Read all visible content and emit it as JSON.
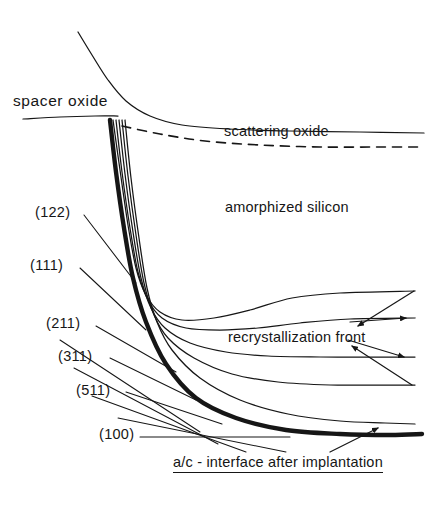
{
  "figure": {
    "domain": "diagram",
    "background_color": "#ffffff",
    "ink_color": "#161616",
    "width": 439,
    "height": 512
  },
  "labels": {
    "spacer_oxide": "spacer  oxide",
    "scattering_oxide": "scattering oxide",
    "amorphized_silicon": "amorphized silicon",
    "recrystallization_front": "recrystallization front",
    "ac_interface": "a/c - interface after implantation"
  },
  "miller_indices": [
    {
      "label": "(122)",
      "id": "122"
    },
    {
      "label": "(111)",
      "id": "111"
    },
    {
      "label": "(211)",
      "id": "211"
    },
    {
      "label": "(311)",
      "id": "311"
    },
    {
      "label": "(511)",
      "id": "511"
    },
    {
      "label": "(100)",
      "id": "100"
    }
  ],
  "chart_data": {
    "type": "line",
    "xlabel": "",
    "ylabel": "",
    "grid": false,
    "legend": "none",
    "axis_ranges": {
      "x": [
        0,
        439
      ],
      "y": [
        0,
        512
      ]
    },
    "note": "Pixel coordinates, y increases downward, matching the source raster.",
    "series": [
      {
        "name": "spacer-oxide-top-surface",
        "style": "solid-thin",
        "points": [
          [
            78,
            32
          ],
          [
            92,
            55
          ],
          [
            108,
            80
          ],
          [
            126,
            101
          ],
          [
            150,
            116
          ],
          [
            182,
            125
          ],
          [
            228,
            129
          ],
          [
            290,
            131
          ],
          [
            360,
            132
          ],
          [
            424,
            133
          ]
        ]
      },
      {
        "name": "spacer-oxide-base-line",
        "style": "solid-thin",
        "points": [
          [
            23,
            119
          ],
          [
            60,
            117
          ],
          [
            95,
            116
          ],
          [
            118,
            116
          ]
        ]
      },
      {
        "name": "scattering-oxide-dashed",
        "style": "dashed",
        "points": [
          [
            122,
            126
          ],
          [
            160,
            134
          ],
          [
            205,
            141
          ],
          [
            260,
            145
          ],
          [
            320,
            147
          ],
          [
            380,
            147
          ],
          [
            424,
            147
          ]
        ]
      },
      {
        "name": "recryst-front-1",
        "style": "solid-thin",
        "points": [
          [
            113,
            120
          ],
          [
            120,
            170
          ],
          [
            128,
            225
          ],
          [
            136,
            268
          ],
          [
            146,
            295
          ],
          [
            160,
            312
          ],
          [
            182,
            320
          ],
          [
            214,
            318
          ],
          [
            250,
            310
          ],
          [
            292,
            298
          ],
          [
            340,
            293
          ],
          [
            415,
            291
          ]
        ]
      },
      {
        "name": "recryst-front-2",
        "style": "solid-thin",
        "points": [
          [
            116,
            120
          ],
          [
            122,
            172
          ],
          [
            130,
            228
          ],
          [
            138,
            272
          ],
          [
            148,
            300
          ],
          [
            162,
            318
          ],
          [
            186,
            328
          ],
          [
            220,
            330
          ],
          [
            258,
            328
          ],
          [
            300,
            323
          ],
          [
            350,
            319
          ],
          [
            415,
            318
          ]
        ]
      },
      {
        "name": "recryst-front-3",
        "style": "solid-thin",
        "points": [
          [
            119,
            120
          ],
          [
            125,
            174
          ],
          [
            133,
            232
          ],
          [
            141,
            278
          ],
          [
            151,
            308
          ],
          [
            165,
            328
          ],
          [
            190,
            343
          ],
          [
            226,
            352
          ],
          [
            268,
            356
          ],
          [
            320,
            357
          ],
          [
            370,
            357
          ],
          [
            415,
            357
          ]
        ]
      },
      {
        "name": "recryst-front-4",
        "style": "solid-thin",
        "points": [
          [
            122,
            120
          ],
          [
            128,
            176
          ],
          [
            136,
            235
          ],
          [
            144,
            283
          ],
          [
            154,
            315
          ],
          [
            168,
            338
          ],
          [
            194,
            358
          ],
          [
            232,
            374
          ],
          [
            278,
            382
          ],
          [
            330,
            385
          ],
          [
            378,
            385
          ],
          [
            415,
            385
          ]
        ]
      },
      {
        "name": "recryst-front-5",
        "style": "solid-thin",
        "points": [
          [
            125,
            120
          ],
          [
            131,
            178
          ],
          [
            139,
            238
          ],
          [
            147,
            288
          ],
          [
            157,
            322
          ],
          [
            172,
            350
          ],
          [
            200,
            378
          ],
          [
            240,
            400
          ],
          [
            288,
            414
          ],
          [
            340,
            421
          ],
          [
            385,
            423
          ],
          [
            415,
            424
          ]
        ]
      },
      {
        "name": "ac-interface-thick",
        "style": "solid-thick",
        "points": [
          [
            110,
            120
          ],
          [
            116,
            172
          ],
          [
            124,
            228
          ],
          [
            133,
            278
          ],
          [
            146,
            322
          ],
          [
            166,
            364
          ],
          [
            196,
            398
          ],
          [
            236,
            418
          ],
          [
            286,
            430
          ],
          [
            340,
            434
          ],
          [
            390,
            435
          ],
          [
            422,
            434
          ]
        ]
      },
      {
        "name": "leader-122",
        "style": "leader",
        "points": [
          [
            84,
            215
          ],
          [
            136,
            283
          ]
        ]
      },
      {
        "name": "leader-111",
        "style": "leader",
        "points": [
          [
            80,
            268
          ],
          [
            146,
            330
          ]
        ]
      },
      {
        "name": "leader-211",
        "style": "leader",
        "points": [
          [
            96,
            326
          ],
          [
            176,
            372
          ]
        ]
      },
      {
        "name": "leader-311",
        "style": "leader",
        "points": [
          [
            110,
            358
          ],
          [
            196,
            400
          ]
        ]
      },
      {
        "name": "leader-511",
        "style": "leader",
        "points": [
          [
            126,
            392
          ],
          [
            222,
            424
          ]
        ]
      },
      {
        "name": "leader-100",
        "style": "leader",
        "points": [
          [
            140,
            437
          ],
          [
            290,
            437
          ]
        ]
      },
      {
        "name": "fan-ray-a",
        "style": "leader",
        "points": [
          [
            60,
            340
          ],
          [
            200,
            432
          ]
        ]
      },
      {
        "name": "fan-ray-b",
        "style": "leader",
        "points": [
          [
            74,
            368
          ],
          [
            218,
            444
          ]
        ]
      },
      {
        "name": "fan-ray-c",
        "style": "leader",
        "points": [
          [
            92,
            396
          ],
          [
            246,
            452
          ]
        ]
      },
      {
        "name": "fan-ray-d",
        "style": "leader",
        "points": [
          [
            118,
            418
          ],
          [
            286,
            452
          ]
        ]
      },
      {
        "name": "arrow-upper",
        "style": "arrow",
        "points": [
          [
            414,
            291
          ],
          [
            358,
            326
          ]
        ]
      },
      {
        "name": "arrow-mid",
        "style": "arrow",
        "points": [
          [
            350,
            322
          ],
          [
            406,
            318
          ]
        ]
      },
      {
        "name": "arrow-lower-a",
        "style": "arrow",
        "points": [
          [
            348,
            340
          ],
          [
            404,
            357
          ]
        ]
      },
      {
        "name": "arrow-lower-b",
        "style": "arrow",
        "points": [
          [
            412,
            385
          ],
          [
            352,
            346
          ]
        ]
      },
      {
        "name": "arrow-ac",
        "style": "arrow",
        "points": [
          [
            330,
            452
          ],
          [
            378,
            428
          ]
        ]
      }
    ]
  }
}
